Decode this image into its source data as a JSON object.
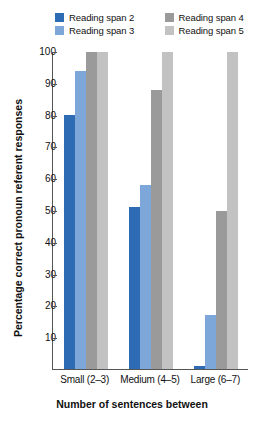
{
  "legend": {
    "items": [
      {
        "label": "Reading span 2",
        "color": "#2d6cb5",
        "name": "legend-item-reading-span-2"
      },
      {
        "label": "Reading span 4",
        "color": "#9a9a9a",
        "name": "legend-item-reading-span-4"
      },
      {
        "label": "Reading span 3",
        "color": "#7da7d9",
        "name": "legend-item-reading-span-3"
      },
      {
        "label": "Reading span 5",
        "color": "#c2c2c2",
        "name": "legend-item-reading-span-5"
      }
    ]
  },
  "axis": {
    "y_title": "Percentage correct pronoun referent responses",
    "x_title": "Number of sentences between",
    "y_ticks": [
      "100",
      "90",
      "80",
      "70",
      "60",
      "50",
      "40",
      "30",
      "20",
      "10"
    ]
  },
  "chart_data": {
    "type": "bar",
    "title": "",
    "subtitle": "",
    "xlabel": "Number of sentences between",
    "ylabel": "Percentage correct pronoun referent responses",
    "ylim": [
      0,
      100
    ],
    "grid": false,
    "legend_position": "top",
    "categories": [
      "Small (2–3)",
      "Medium (4–5)",
      "Large (6–7)"
    ],
    "series": [
      {
        "name": "Reading span 2",
        "color": "#2d6cb5",
        "values": [
          80,
          51,
          1
        ]
      },
      {
        "name": "Reading span 3",
        "color": "#7da7d9",
        "values": [
          94,
          58,
          17
        ]
      },
      {
        "name": "Reading span 4",
        "color": "#9a9a9a",
        "values": [
          100,
          88,
          50
        ]
      },
      {
        "name": "Reading span 5",
        "color": "#c2c2c2",
        "values": [
          100,
          100,
          100
        ]
      }
    ]
  }
}
